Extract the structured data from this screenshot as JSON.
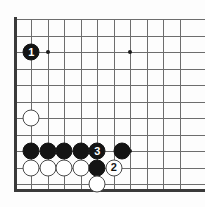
{
  "figure": {
    "kind": "go-board-diagram",
    "board_background_color": "#fdfdfd",
    "grid_line_color": "#6d6d6d",
    "border_line_color": "#3a3a3a",
    "black_stone_color": "#141414",
    "white_stone_color": "#ffffff"
  },
  "board": {
    "grid_spacing": 16.5,
    "origin_x": 14.5,
    "origin_y": 19,
    "columns": 11,
    "rows": 11,
    "left_edge_x": 14.5,
    "bottom_edge_y": 190,
    "vertical_lines_x": [
      14.5,
      31,
      47.5,
      64,
      80.5,
      97,
      113.5,
      130,
      146.5,
      163,
      179.5
    ],
    "horizontal_lines_y": [
      19,
      35.5,
      52,
      68.5,
      85,
      101.5,
      118,
      134.5,
      151,
      167.5,
      184
    ],
    "star_points": [
      {
        "name": "star-point-upper-left",
        "x": 47.5,
        "y": 52
      },
      {
        "name": "star-point-upper-right",
        "x": 130,
        "y": 52
      },
      {
        "name": "star-point-lower-right",
        "x": 130,
        "y": 151
      }
    ]
  },
  "stones": [
    {
      "name": "black-stone-move-1",
      "color": "black",
      "label": "1",
      "x": 31,
      "y": 52
    },
    {
      "name": "white-stone-a",
      "color": "white",
      "label": "",
      "x": 31,
      "y": 118
    },
    {
      "name": "black-stone-b",
      "color": "black",
      "label": "",
      "x": 31,
      "y": 151
    },
    {
      "name": "black-stone-c",
      "color": "black",
      "label": "",
      "x": 47.5,
      "y": 151
    },
    {
      "name": "black-stone-d",
      "color": "black",
      "label": "",
      "x": 64,
      "y": 151
    },
    {
      "name": "black-stone-e",
      "color": "black",
      "label": "",
      "x": 80.5,
      "y": 151
    },
    {
      "name": "black-stone-move-3",
      "color": "black",
      "label": "3",
      "x": 97,
      "y": 151
    },
    {
      "name": "black-stone-f",
      "color": "black",
      "label": "",
      "x": 122,
      "y": 151
    },
    {
      "name": "white-stone-g",
      "color": "white",
      "label": "",
      "x": 31,
      "y": 167.5
    },
    {
      "name": "white-stone-h",
      "color": "white",
      "label": "",
      "x": 47.5,
      "y": 167.5
    },
    {
      "name": "white-stone-i",
      "color": "white",
      "label": "",
      "x": 64,
      "y": 167.5
    },
    {
      "name": "white-stone-j",
      "color": "white",
      "label": "",
      "x": 80.5,
      "y": 167.5
    },
    {
      "name": "black-stone-k",
      "color": "black",
      "label": "",
      "x": 97,
      "y": 167.5
    },
    {
      "name": "white-stone-move-2",
      "color": "white",
      "label": "2",
      "x": 113.5,
      "y": 167.5
    },
    {
      "name": "white-stone-l",
      "color": "white",
      "label": "",
      "x": 97,
      "y": 184
    }
  ]
}
